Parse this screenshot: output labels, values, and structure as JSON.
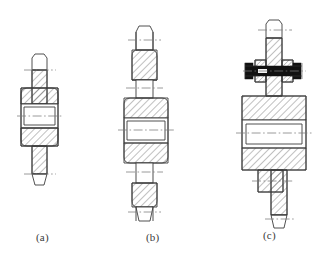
{
  "figure": {
    "title": "",
    "background_color": "#ffffff",
    "line_color": "#3c3c3c",
    "hatch_color": "#4a4a4a",
    "centerline_color": "#7a7a7a",
    "bolt_fill_color": "#111111",
    "caption_color": "#3a3a3a"
  },
  "captions": [
    {
      "label": "(a)",
      "x": 36,
      "y": 236
    },
    {
      "label": "(b)",
      "x": 146,
      "y": 236
    },
    {
      "label": "(c)",
      "x": 263,
      "y": 234
    }
  ],
  "views": [
    {
      "id": "a",
      "name": "single-shaft-hub-section",
      "caption": "(a)",
      "features": [
        "upper-shaft-stub",
        "hub-body",
        "bore",
        "lower-shaft-stub",
        "section-hatching",
        "centerlines"
      ]
    },
    {
      "id": "b",
      "name": "double-stepped-shaft-hub-section",
      "caption": "(b)",
      "features": [
        "upper-stepped-shaft",
        "hub-body",
        "bore",
        "lower-stepped-shaft",
        "section-hatching",
        "centerlines"
      ]
    },
    {
      "id": "c",
      "name": "bolted-shaft-hub-section",
      "caption": "(c)",
      "features": [
        "upper-shaft",
        "bolt-and-nut-assembly",
        "hub-body",
        "bore",
        "lower-shaft",
        "section-hatching",
        "centerlines"
      ]
    }
  ],
  "annotations": {
    "hatch_angle_deg": 45,
    "centerline_style": "dash-dot"
  }
}
